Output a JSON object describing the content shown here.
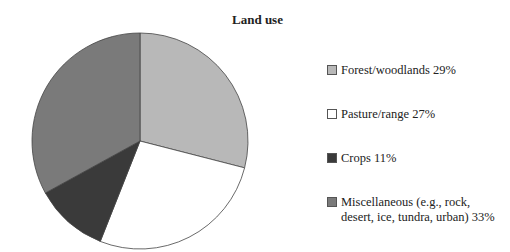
{
  "chart_data": {
    "type": "pie",
    "title": "Land use",
    "categories": [
      "Forest/woodlands",
      "Pasture/range",
      "Crops",
      "Miscellaneous (e.g., rock, desert, ice, tundra, urban)"
    ],
    "values": [
      29,
      27,
      11,
      33
    ],
    "unit": "%",
    "colors": [
      "#b8b8b8",
      "#ffffff",
      "#3a3a3a",
      "#7a7a7a"
    ],
    "legend_position": "right"
  },
  "legend": [
    {
      "label": "Forest/woodlands 29%",
      "color": "#b8b8b8"
    },
    {
      "label": "Pasture/range 27%",
      "color": "#ffffff"
    },
    {
      "label": "Crops 11%",
      "color": "#3a3a3a"
    },
    {
      "label_line1": "Miscellaneous (e.g., rock,",
      "label_line2": "desert, ice, tundra, urban) 33%",
      "color": "#7a7a7a"
    }
  ]
}
